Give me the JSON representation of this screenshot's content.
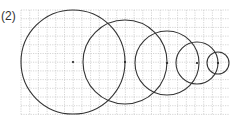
{
  "figure": {
    "label": "(2)",
    "grid": {
      "x0": 21,
      "y0": 10,
      "x1": 229,
      "y1": 115,
      "cell": 8.7,
      "color": "#bbbbbb"
    },
    "stroke_color": "#333333",
    "circles": [
      {
        "cx": 73,
        "cy": 62,
        "r": 52
      },
      {
        "cx": 125,
        "cy": 62,
        "r": 42
      },
      {
        "cx": 167,
        "cy": 63,
        "r": 32
      },
      {
        "cx": 197,
        "cy": 63,
        "r": 21
      },
      {
        "cx": 218,
        "cy": 63,
        "r": 11
      }
    ]
  }
}
